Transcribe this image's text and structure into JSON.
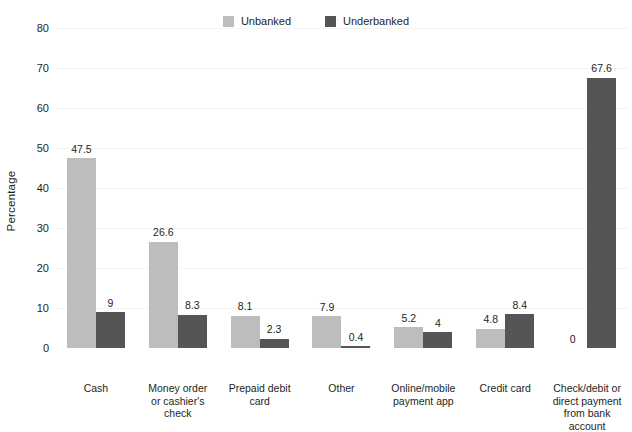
{
  "chart_data": {
    "type": "bar",
    "title": "",
    "subtitle": "",
    "xlabel": "",
    "ylabel": "Percentage",
    "ylim": [
      0,
      80
    ],
    "ytick_step": 10,
    "yticks": [
      0,
      10,
      20,
      30,
      40,
      50,
      60,
      70,
      80
    ],
    "grid": true,
    "grid_axis": "y",
    "legend_position": "top-center",
    "categories": [
      "Cash",
      "Money order or cashier's check",
      "Prepaid debit card",
      "Other",
      "Online/mobile payment app",
      "Credit card",
      "Check/debit or direct payment from bank account"
    ],
    "category_lines": [
      [
        "Cash"
      ],
      [
        "Money order",
        "or cashier's",
        "check"
      ],
      [
        "Prepaid debit",
        "card"
      ],
      [
        "Other"
      ],
      [
        "Online/mobile",
        "payment app"
      ],
      [
        "Credit card"
      ],
      [
        "Check/debit or",
        "direct payment",
        "from bank account"
      ]
    ],
    "series": [
      {
        "name": "Unbanked",
        "color": "#bdbdbd",
        "values": [
          47.5,
          26.6,
          8.1,
          7.9,
          5.2,
          4.8,
          0
        ],
        "labels": [
          "47.5",
          "26.6",
          "8.1",
          "7.9",
          "5.2",
          "4.8",
          "0"
        ]
      },
      {
        "name": "Underbanked",
        "color": "#555555",
        "values": [
          9,
          8.3,
          2.3,
          0.4,
          4,
          8.4,
          67.6
        ],
        "labels": [
          "9",
          "8.3",
          "2.3",
          "0.4",
          "4",
          "8.4",
          "67.6"
        ]
      }
    ]
  },
  "legend": {
    "items": [
      {
        "label": "Unbanked",
        "color": "#bdbdbd"
      },
      {
        "label": "Underbanked",
        "color": "#555555"
      }
    ]
  },
  "axes": {
    "y_title": "Percentage",
    "y_tick_labels": [
      "80",
      "70",
      "60",
      "50",
      "40",
      "30",
      "20",
      "10",
      "0"
    ]
  },
  "colors": {
    "background": "#ffffff",
    "text": "#231f20",
    "gridline": "#f4f4f4",
    "unbanked": "#bdbdbd",
    "underbanked": "#555555"
  }
}
